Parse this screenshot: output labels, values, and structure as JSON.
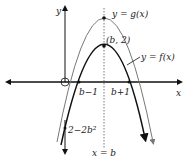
{
  "labels": {
    "y_axis": "y",
    "x_axis": "x",
    "g_curve": "y = g(x)",
    "f_curve": "y = f(x)",
    "vertex_f": "(b, 2)",
    "root_left": "b−1",
    "root_right": "b+1",
    "y_intercept": "2−2b²",
    "symmetry_line": "x = b"
  },
  "colors": {
    "f_curve": "#111111",
    "g_curve": "#777777",
    "axes": "#111111"
  }
}
